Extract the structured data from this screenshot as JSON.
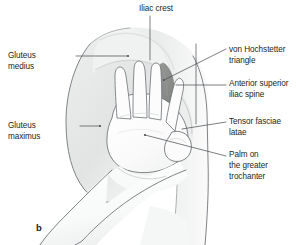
{
  "figure": {
    "panel_letter": "b",
    "background_color": "#ffffff",
    "line_color": "#5b5f63",
    "text_color": "#231f20",
    "triangle_fill": "#8a8d8a",
    "skin_shade": "#e9eaea",
    "skin_shade_light": "#f3f4f4"
  },
  "labels": {
    "iliac_crest": "Iliac crest",
    "gluteus_medius": "Gluteus\nmedius",
    "gluteus_maximus": "Gluteus\nmaximus",
    "hochstetter_triangle": "von Hochstetter\ntriangle",
    "anterior_superior_iliac_spine": "Anterior superior\niliac spine",
    "tensor_fasciae_latae": "Tensor fasciae\nlatae",
    "palm_greater_trochanter": "Palm on\nthe greater\ntrochanter"
  }
}
